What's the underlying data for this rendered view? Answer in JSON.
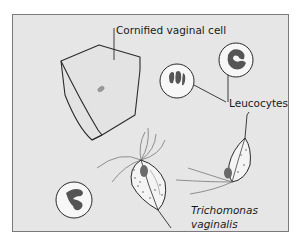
{
  "diagram": {
    "background_color": "#e6e6e6",
    "frame_border_color": "#7a7a7a",
    "line_color": "#2a2a2a",
    "nucleus_color": "#5a5a5a",
    "labels": {
      "cornified_cell": "Cornified vaginal cell",
      "leucocytes": "Leucocytes",
      "trichomonas_line1": "Trichomonas",
      "trichomonas_line2": "vaginalis"
    },
    "elements": [
      "cornified-vaginal-cell",
      "leucocyte-top-left",
      "leucocyte-top-right",
      "leucocyte-bottom-left",
      "trichomonas-large",
      "trichomonas-small"
    ]
  }
}
